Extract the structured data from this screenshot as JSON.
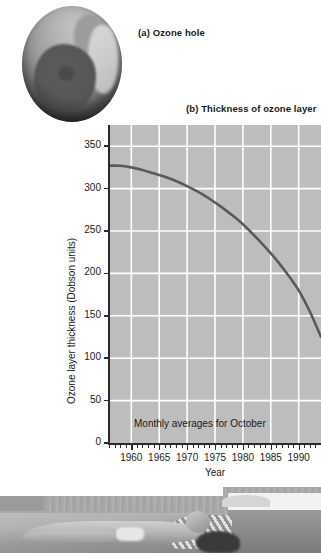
{
  "figure": {
    "panel_a_caption": "(a) Ozone hole",
    "panel_b_caption": "(b) Thickness of ozone layer"
  },
  "chart_data": {
    "type": "line",
    "title": "(b) Thickness of ozone layer",
    "xlabel": "Year",
    "ylabel": "Ozone layer thickness (Dobson units)",
    "annotation": "Monthly averages for October",
    "xlim": [
      1956,
      1994
    ],
    "ylim": [
      0,
      375
    ],
    "xticks": [
      1960,
      1965,
      1970,
      1975,
      1980,
      1985,
      1990
    ],
    "xtick_labels": [
      "1960",
      "1965",
      "1970",
      "1975",
      "1980",
      "1985",
      "1990"
    ],
    "yticks": [
      0,
      50,
      100,
      150,
      200,
      250,
      300,
      350
    ],
    "ytick_labels": [
      "0",
      "50",
      "100",
      "150",
      "200",
      "250",
      "300",
      "350"
    ],
    "minor_xtick_interval": 1,
    "grid": true,
    "grid_color": "#ffffff",
    "plot_background": "#bdbdbd",
    "line_color": "#5a5a5a",
    "legend": "none",
    "x": [
      1956,
      1958,
      1960,
      1962,
      1964,
      1966,
      1968,
      1970,
      1972,
      1974,
      1976,
      1978,
      1980,
      1982,
      1984,
      1986,
      1988,
      1990,
      1992,
      1994
    ],
    "values": [
      327,
      327,
      325,
      322,
      318,
      314,
      309,
      303,
      296,
      288,
      279,
      269,
      258,
      245,
      231,
      216,
      199,
      180,
      155,
      125
    ]
  },
  "axis": {
    "y_title": "Ozone layer thickness (Dobson units)",
    "x_title": "Year"
  }
}
